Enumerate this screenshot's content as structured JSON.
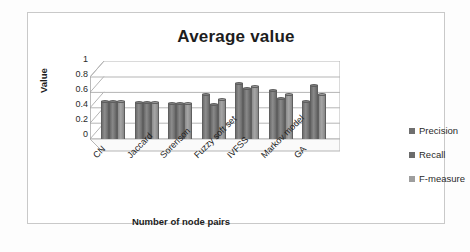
{
  "chart_data": {
    "type": "bar",
    "title": "Average value",
    "xlabel": "Number of node pairs",
    "ylabel": "Value",
    "categories": [
      "CN",
      "Jaccard",
      "Sorenson",
      "Fuzzy soft set",
      "IVFSS",
      "Markov model",
      "GA"
    ],
    "series": [
      {
        "name": "Precision",
        "values": [
          0.61,
          0.6,
          0.58,
          0.73,
          0.9,
          0.79,
          0.62
        ]
      },
      {
        "name": "Recall",
        "values": [
          0.61,
          0.6,
          0.58,
          0.57,
          0.83,
          0.66,
          0.87
        ]
      },
      {
        "name": "F-measure",
        "values": [
          0.61,
          0.6,
          0.58,
          0.65,
          0.86,
          0.72,
          0.73
        ]
      }
    ],
    "ylim": [
      0,
      1
    ],
    "yticks": [
      "0",
      "0.2",
      "0.4",
      "0.6",
      "0.8",
      "1"
    ],
    "grid": true,
    "legend_position": "right",
    "style": "3d-clustered-column",
    "colors": {
      "precision": "#6f6f6f",
      "recall": "#6b6b6b",
      "fmeasure": "#9e9e9e",
      "gridline": "#b5b5b5",
      "frame": "#c9c9c9",
      "text": "#1d1d1d"
    }
  },
  "legend": {
    "items": [
      {
        "label": "Precision"
      },
      {
        "label": "Recall"
      },
      {
        "label": "F-measure"
      }
    ]
  }
}
